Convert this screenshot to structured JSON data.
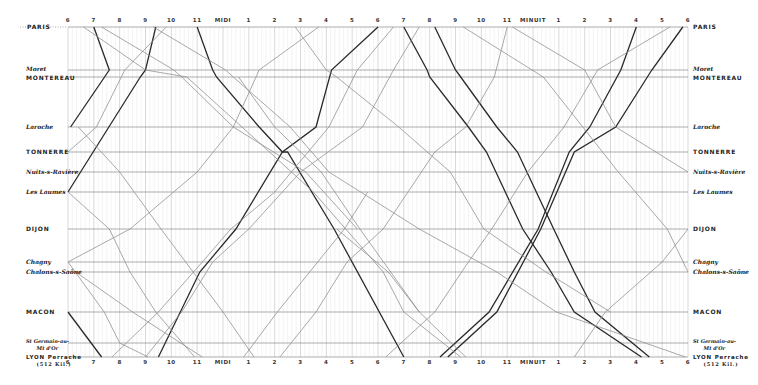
{
  "chart_data": {
    "type": "line",
    "xlabel": "Time of day (6h → 6h next day)",
    "ylabel": "Stations (distance along line)",
    "x_ticks": [
      "6",
      "7",
      "8",
      "9",
      "10",
      "11",
      "MIDI",
      "1",
      "2",
      "3",
      "4",
      "5",
      "6",
      "7",
      "8",
      "9",
      "10",
      "11",
      "MINUIT",
      "1",
      "2",
      "3",
      "4",
      "5",
      "6"
    ],
    "x_range_hours": [
      6,
      30
    ],
    "grid": true,
    "stations": [
      {
        "name": "PARIS",
        "style": "caps",
        "y": 27
      },
      {
        "name": "Moret",
        "style": "ital",
        "y": 70
      },
      {
        "name": "MONTEREAU",
        "style": "caps",
        "y": 77
      },
      {
        "name": "Laroche",
        "style": "ital",
        "y": 127
      },
      {
        "name": "TONNERRE",
        "style": "caps",
        "y": 152
      },
      {
        "name": "Nuits-s-Ravière",
        "style": "ital",
        "y": 172
      },
      {
        "name": "Les Laumes",
        "style": "ital",
        "y": 192
      },
      {
        "name": "DIJON",
        "style": "caps",
        "y": 229
      },
      {
        "name": "Chagny",
        "style": "ital",
        "y": 262
      },
      {
        "name": "Chalons-s-Saône",
        "style": "ital",
        "y": 272
      },
      {
        "name": "MACON",
        "style": "caps",
        "y": 312
      },
      {
        "name": "St Germain-au-Mt d'Or",
        "style": "ital",
        "y": 343
      },
      {
        "name": "LYON Perrache",
        "sub": "(512 Kil.)",
        "style": "caps",
        "y": 357
      }
    ],
    "series": [
      {
        "name": "express-down-1",
        "weight": "heavy",
        "points": [
          [
            11.0,
            0
          ],
          [
            11.6,
            1
          ],
          [
            11.75,
            2
          ],
          [
            13.4,
            3
          ],
          [
            14.3,
            4
          ],
          [
            14.5,
            4
          ],
          [
            16.3,
            7
          ],
          [
            19.0,
            12
          ]
        ]
      },
      {
        "name": "express-down-2",
        "weight": "heavy",
        "points": [
          [
            19.0,
            0
          ],
          [
            19.9,
            1
          ],
          [
            20.0,
            2
          ],
          [
            21.5,
            3
          ],
          [
            22.2,
            4
          ],
          [
            23.6,
            7
          ],
          [
            24.7,
            9
          ],
          [
            25.6,
            10
          ],
          [
            28.2,
            12
          ]
        ]
      },
      {
        "name": "express-down-3",
        "weight": "heavy",
        "points": [
          [
            20.2,
            0
          ],
          [
            21.0,
            1
          ],
          [
            21.2,
            2
          ],
          [
            22.6,
            3
          ],
          [
            23.4,
            4
          ],
          [
            24.8,
            7
          ],
          [
            25.6,
            9
          ],
          [
            26.4,
            10
          ],
          [
            28.5,
            12
          ]
        ]
      },
      {
        "name": "express-down-4",
        "weight": "heavy",
        "points": [
          [
            6.0,
            10
          ],
          [
            7.3,
            12
          ]
        ]
      },
      {
        "name": "express-up-1",
        "weight": "heavy",
        "points": [
          [
            6.1,
            3
          ],
          [
            7.6,
            1
          ],
          [
            7.0,
            0
          ]
        ]
      },
      {
        "name": "express-up-2",
        "weight": "heavy",
        "points": [
          [
            9.5,
            12
          ],
          [
            11.1,
            9
          ],
          [
            12.5,
            7
          ],
          [
            14.3,
            4
          ],
          [
            15.6,
            3
          ],
          [
            16.2,
            1
          ],
          [
            18.0,
            0
          ]
        ]
      },
      {
        "name": "express-up-3",
        "weight": "heavy",
        "points": [
          [
            20.4,
            12
          ],
          [
            22.3,
            10
          ],
          [
            24.2,
            7
          ],
          [
            25.4,
            4
          ],
          [
            26.2,
            3
          ],
          [
            27.4,
            1
          ],
          [
            28.0,
            0
          ]
        ]
      },
      {
        "name": "express-up-4",
        "weight": "heavy",
        "points": [
          [
            20.7,
            12
          ],
          [
            22.6,
            10
          ],
          [
            24.3,
            7
          ],
          [
            25.6,
            4
          ],
          [
            27.2,
            3
          ],
          [
            28.6,
            1
          ],
          [
            29.8,
            0
          ]
        ]
      },
      {
        "name": "express-up-5",
        "weight": "heavy",
        "points": [
          [
            6.0,
            6
          ],
          [
            8.8,
            2
          ],
          [
            9.0,
            1
          ],
          [
            9.4,
            0
          ]
        ]
      },
      {
        "name": "local-1",
        "weight": "light",
        "points": [
          [
            7.3,
            0
          ],
          [
            10.1,
            1
          ],
          [
            10.4,
            2
          ],
          [
            12.4,
            3
          ],
          [
            15.2,
            5
          ],
          [
            17.2,
            7
          ]
        ]
      },
      {
        "name": "local-2",
        "weight": "light",
        "points": [
          [
            9.3,
            0
          ],
          [
            12.1,
            1
          ],
          [
            12.4,
            2
          ],
          [
            14.6,
            3
          ],
          [
            16.1,
            5
          ],
          [
            19.6,
            7
          ],
          [
            22.6,
            9
          ],
          [
            24.9,
            10
          ],
          [
            29.9,
            12
          ]
        ]
      },
      {
        "name": "local-3",
        "weight": "light",
        "points": [
          [
            14.8,
            0
          ],
          [
            16.0,
            1
          ],
          [
            16.4,
            2
          ],
          [
            18.8,
            3
          ],
          [
            20.8,
            5
          ],
          [
            22.1,
            7
          ],
          [
            24.5,
            9
          ],
          [
            27.0,
            10
          ]
        ]
      },
      {
        "name": "local-4",
        "weight": "light",
        "points": [
          [
            6.6,
            0
          ],
          [
            9.0,
            1
          ],
          [
            10.6,
            2
          ],
          [
            13.8,
            4
          ],
          [
            15.5,
            6
          ],
          [
            18.2,
            9
          ],
          [
            19.0,
            10
          ],
          [
            21.2,
            12
          ]
        ]
      },
      {
        "name": "local-5",
        "weight": "light",
        "points": [
          [
            6.0,
            6
          ],
          [
            7.6,
            7
          ],
          [
            8.4,
            9
          ],
          [
            9.4,
            10
          ],
          [
            10.9,
            12
          ]
        ]
      },
      {
        "name": "local-6",
        "weight": "light",
        "points": [
          [
            12.6,
            2
          ],
          [
            14.0,
            3
          ],
          [
            15.8,
            5
          ],
          [
            17.3,
            7
          ],
          [
            19.6,
            10
          ]
        ]
      },
      {
        "name": "local-7",
        "weight": "light",
        "points": [
          [
            21.3,
            0
          ],
          [
            24.4,
            2
          ],
          [
            27.3,
            5
          ],
          [
            29.2,
            7
          ],
          [
            30.0,
            9
          ]
        ]
      },
      {
        "name": "local-8",
        "weight": "light",
        "points": [
          [
            6.0,
            8
          ],
          [
            7.4,
            10
          ],
          [
            8.0,
            11
          ],
          [
            9.1,
            12
          ]
        ]
      },
      {
        "name": "local-up-1",
        "weight": "light",
        "points": [
          [
            6.0,
            8
          ],
          [
            8.4,
            7
          ],
          [
            11.0,
            5
          ],
          [
            12.4,
            3
          ],
          [
            13.4,
            1
          ],
          [
            15.7,
            0
          ]
        ]
      },
      {
        "name": "local-up-2",
        "weight": "light",
        "points": [
          [
            9.0,
            12
          ],
          [
            10.4,
            10
          ],
          [
            11.6,
            8
          ],
          [
            13.0,
            7
          ],
          [
            15.0,
            5
          ],
          [
            17.4,
            3
          ],
          [
            18.6,
            1
          ],
          [
            19.6,
            0
          ]
        ]
      },
      {
        "name": "local-up-3",
        "weight": "light",
        "points": [
          [
            7.7,
            12
          ],
          [
            9.5,
            10
          ],
          [
            11.2,
            8
          ],
          [
            12.3,
            7
          ],
          [
            14.0,
            6
          ],
          [
            16.1,
            3
          ],
          [
            17.2,
            1
          ],
          [
            18.6,
            0
          ]
        ]
      },
      {
        "name": "local-up-4",
        "weight": "light",
        "points": [
          [
            18.3,
            12
          ],
          [
            20.2,
            10
          ],
          [
            21.5,
            8
          ],
          [
            22.4,
            7
          ],
          [
            23.8,
            5
          ],
          [
            25.2,
            3
          ],
          [
            26.5,
            1
          ],
          [
            29.3,
            0
          ]
        ]
      },
      {
        "name": "local-up-5",
        "weight": "light",
        "points": [
          [
            25.6,
            12
          ],
          [
            26.8,
            10
          ],
          [
            29.0,
            8
          ],
          [
            30.0,
            7
          ]
        ]
      },
      {
        "name": "local-up-6",
        "weight": "light",
        "points": [
          [
            14.2,
            12
          ],
          [
            15.6,
            10
          ],
          [
            16.8,
            8
          ],
          [
            18.2,
            7
          ],
          [
            20.2,
            4
          ],
          [
            21.4,
            3
          ],
          [
            22.5,
            2
          ],
          [
            23.0,
            0
          ]
        ]
      },
      {
        "name": "local-up-7",
        "weight": "light",
        "points": [
          [
            6.0,
            4
          ],
          [
            7.1,
            3
          ],
          [
            8.2,
            1
          ],
          [
            9.8,
            0
          ]
        ]
      },
      {
        "name": "local-up-8",
        "weight": "light",
        "points": [
          [
            12.8,
            12
          ],
          [
            14.1,
            10
          ],
          [
            16.7,
            7
          ],
          [
            17.6,
            6
          ]
        ]
      },
      {
        "name": "local-down-9",
        "weight": "light",
        "points": [
          [
            6.4,
            3
          ],
          [
            8.0,
            5
          ],
          [
            9.6,
            7
          ],
          [
            12.0,
            10
          ],
          [
            13.2,
            12
          ]
        ]
      },
      {
        "name": "local-down-10",
        "weight": "light",
        "points": [
          [
            6.3,
            9
          ],
          [
            8.5,
            10
          ],
          [
            11.2,
            12
          ]
        ]
      },
      {
        "name": "local-down-11",
        "weight": "light",
        "points": [
          [
            23.2,
            0
          ],
          [
            26.0,
            1
          ],
          [
            27.2,
            3
          ],
          [
            30.0,
            5
          ]
        ]
      },
      {
        "name": "local-down-12",
        "weight": "light",
        "points": [
          [
            16.4,
            7
          ],
          [
            18.4,
            9
          ],
          [
            19.6,
            10
          ],
          [
            21.4,
            12
          ]
        ]
      }
    ]
  },
  "labels": {
    "left": [
      "PARIS",
      "Moret",
      "MONTEREAU",
      "Laroche",
      "TONNERRE",
      "Nuits-s-Ravière",
      "Les Laumes",
      "DIJON",
      "Chagny",
      "Chalons-s-Saône",
      "MACON",
      "St Germain-au-Mt d'Or",
      "LYON Perrache"
    ],
    "lyon_sub": "(512 Kil.)"
  }
}
